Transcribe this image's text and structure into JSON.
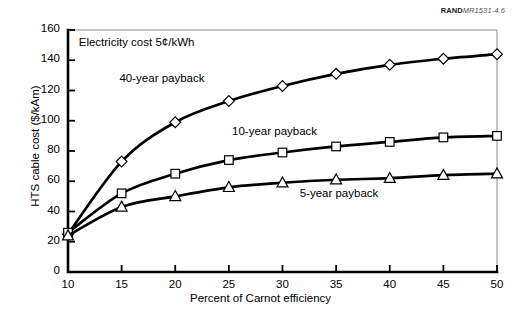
{
  "source_id": {
    "bold": "RAND",
    "rest": "MR1531-4.6"
  },
  "chart_data": {
    "type": "line",
    "title": "",
    "xlabel": "Percent of Carnot efficiency",
    "ylabel": "HTS cable cost ($/kAm)",
    "xlim": [
      10,
      50
    ],
    "ylim": [
      0,
      160
    ],
    "xticks": [
      10,
      15,
      20,
      25,
      30,
      35,
      40,
      45,
      50
    ],
    "yticks": [
      0,
      20,
      40,
      60,
      80,
      100,
      120,
      140,
      160
    ],
    "grid": false,
    "legend_position": "inline-annotations",
    "x": [
      10,
      15,
      20,
      25,
      30,
      35,
      40,
      45,
      50
    ],
    "series": [
      {
        "name": "40-year payback",
        "marker": "diamond",
        "values": [
          25,
          73,
          99,
          113,
          123,
          131,
          137,
          141,
          144
        ]
      },
      {
        "name": "10-year payback",
        "marker": "square",
        "values": [
          26,
          52,
          65,
          74,
          79,
          83,
          86,
          89,
          90
        ]
      },
      {
        "name": "5-year payback",
        "marker": "triangle",
        "values": [
          24,
          43,
          50,
          56,
          59,
          61,
          62,
          64,
          65
        ]
      }
    ],
    "annotations": [
      {
        "text": "Electricity cost 5¢/kWh",
        "x": 11.0,
        "y": 151
      },
      {
        "text": "40-year payback",
        "x": 14.8,
        "y": 127
      },
      {
        "text": "10-year payback",
        "x": 25.3,
        "y": 92
      },
      {
        "text": "5-year payback",
        "x": 31.6,
        "y": 51
      }
    ],
    "colors": {
      "line": "#000000",
      "marker_fill": "#ffffff",
      "marker_stroke": "#000000",
      "axis": "#000000",
      "frame": "#8c8c8c",
      "background": "#ffffff"
    }
  }
}
